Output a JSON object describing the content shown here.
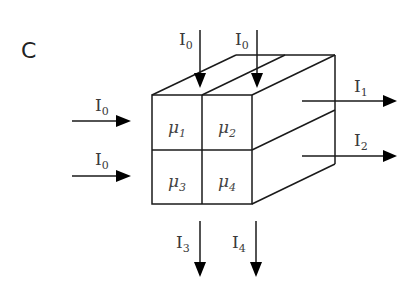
{
  "panel_label": "C",
  "cells": [
    {
      "symbol": "μ",
      "sub": "1"
    },
    {
      "symbol": "μ",
      "sub": "2"
    },
    {
      "symbol": "μ",
      "sub": "3"
    },
    {
      "symbol": "μ",
      "sub": "4"
    }
  ],
  "inputs": {
    "top_left": {
      "symbol": "I",
      "sub": "0"
    },
    "top_right": {
      "symbol": "I",
      "sub": "0"
    },
    "left_top": {
      "symbol": "I",
      "sub": "0"
    },
    "left_bottom": {
      "symbol": "I",
      "sub": "0"
    }
  },
  "outputs": {
    "right_top": {
      "symbol": "I",
      "sub": "1"
    },
    "right_bottom": {
      "symbol": "I",
      "sub": "2"
    },
    "bottom_left": {
      "symbol": "I",
      "sub": "3"
    },
    "bottom_right": {
      "symbol": "I",
      "sub": "4"
    }
  }
}
